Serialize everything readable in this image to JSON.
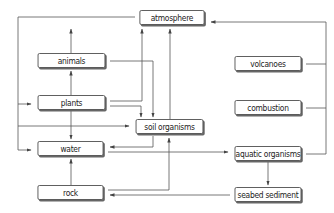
{
  "diagram": {
    "type": "flow",
    "nodes": {
      "atmosphere": {
        "label": "atmosphere"
      },
      "animals": {
        "label": "animals"
      },
      "plants": {
        "label": "plants"
      },
      "soil_organisms": {
        "label": "soil organisms"
      },
      "water": {
        "label": "water"
      },
      "rock": {
        "label": "rock"
      },
      "volcanoes": {
        "label": "volcanoes"
      },
      "combustion": {
        "label": "combustion"
      },
      "aquatic_organisms": {
        "label": "aquatic organisms"
      },
      "seabed_sediment": {
        "label": "seabed sediment"
      }
    },
    "edges": [
      {
        "from": "atmosphere",
        "to": "plants"
      },
      {
        "from": "atmosphere",
        "to": "water"
      },
      {
        "from": "animals",
        "to": "atmosphere"
      },
      {
        "from": "animals",
        "to": "soil_organisms"
      },
      {
        "from": "plants",
        "to": "animals"
      },
      {
        "from": "plants",
        "to": "atmosphere"
      },
      {
        "from": "plants",
        "to": "soil_organisms"
      },
      {
        "from": "plants",
        "to": "water"
      },
      {
        "from": "soil_organisms",
        "to": "atmosphere"
      },
      {
        "from": "soil_organisms",
        "to": "water"
      },
      {
        "from": "water",
        "to": "aquatic_organisms"
      },
      {
        "from": "rock",
        "to": "water"
      },
      {
        "from": "rock",
        "to": "soil_organisms"
      },
      {
        "from": "volcanoes",
        "to": "atmosphere"
      },
      {
        "from": "combustion",
        "to": "atmosphere"
      },
      {
        "from": "aquatic_organisms",
        "to": "atmosphere"
      },
      {
        "from": "aquatic_organisms",
        "to": "seabed_sediment"
      },
      {
        "from": "seabed_sediment",
        "to": "rock"
      }
    ]
  }
}
